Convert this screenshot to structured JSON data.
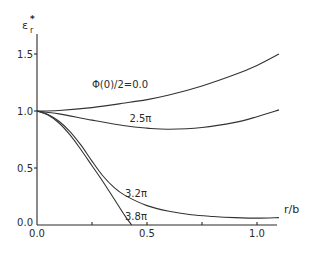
{
  "chart_data": {
    "type": "line",
    "title": "",
    "xlabel": "r/b",
    "ylabel": "ε_r*",
    "ylabel_main": "ε",
    "ylabel_sub": "r",
    "ylabel_sup": "*",
    "xlim": [
      0.0,
      1.1
    ],
    "ylim": [
      0.0,
      1.6
    ],
    "grid": false,
    "legend": "none (inline curve labels)",
    "x_ticks": [
      {
        "value": 0.0,
        "label": "0.0"
      },
      {
        "value": 0.25,
        "label": ""
      },
      {
        "value": 0.5,
        "label": "0.5"
      },
      {
        "value": 0.75,
        "label": ""
      },
      {
        "value": 1.0,
        "label": "1.0"
      }
    ],
    "y_ticks": [
      {
        "value": 0.0,
        "label": "0.0"
      },
      {
        "value": 0.5,
        "label": "0.5"
      },
      {
        "value": 1.0,
        "label": "1.0"
      },
      {
        "value": 1.5,
        "label": "1.5"
      }
    ],
    "series": [
      {
        "name": "Φ(0)/2=0.0",
        "label": "Φ(0)/2=0.0",
        "label_at": [
          0.25,
          1.2
        ],
        "x": [
          0.0,
          0.1,
          0.25,
          0.4,
          0.5,
          0.6,
          0.75,
          0.9,
          1.0,
          1.1
        ],
        "y": [
          1.0,
          1.005,
          1.03,
          1.07,
          1.1,
          1.14,
          1.22,
          1.32,
          1.4,
          1.5
        ]
      },
      {
        "name": "2.5π",
        "label": "2.5π",
        "label_at": [
          0.42,
          0.9
        ],
        "x": [
          0.0,
          0.1,
          0.25,
          0.4,
          0.5,
          0.6,
          0.75,
          0.9,
          1.0,
          1.1
        ],
        "y": [
          1.0,
          0.975,
          0.92,
          0.87,
          0.85,
          0.84,
          0.855,
          0.9,
          0.95,
          1.01
        ]
      },
      {
        "name": "3.2π",
        "label": "3.2π",
        "label_at": [
          0.4,
          0.25
        ],
        "x": [
          0.0,
          0.05,
          0.1,
          0.15,
          0.2,
          0.25,
          0.3,
          0.35,
          0.4,
          0.5,
          0.6,
          0.7,
          0.8,
          0.9,
          1.0,
          1.1
        ],
        "y": [
          1.0,
          0.97,
          0.91,
          0.82,
          0.7,
          0.56,
          0.43,
          0.33,
          0.26,
          0.17,
          0.12,
          0.09,
          0.075,
          0.065,
          0.06,
          0.065
        ]
      },
      {
        "name": "3.8π",
        "label": "3.8π",
        "label_at": [
          0.4,
          0.04
        ],
        "x": [
          0.0,
          0.05,
          0.1,
          0.15,
          0.2,
          0.25,
          0.3,
          0.35,
          0.4,
          0.43
        ],
        "y": [
          1.0,
          0.965,
          0.895,
          0.79,
          0.66,
          0.52,
          0.38,
          0.23,
          0.08,
          0.0
        ]
      }
    ]
  }
}
